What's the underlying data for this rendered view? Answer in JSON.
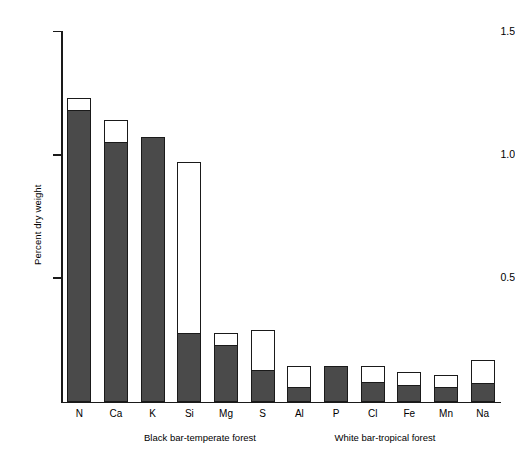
{
  "chart_data": {
    "type": "bar",
    "title": "",
    "xlabel": "",
    "ylabel": "Percent dry weight",
    "ylim": [
      0,
      1.5
    ],
    "yticks": [
      0.5,
      1.0,
      1.5
    ],
    "ytick_labels": [
      "0.5",
      "1.0",
      "1.5"
    ],
    "grid": false,
    "legend_position": "below-axis",
    "categories": [
      "N",
      "Ca",
      "K",
      "Si",
      "Mg",
      "S",
      "Al",
      "P",
      "Cl",
      "Fe",
      "Mn",
      "Na"
    ],
    "series": [
      {
        "name": "Black bar-temperate forest",
        "color": "#4a4a4a",
        "values": [
          1.18,
          1.05,
          1.07,
          0.28,
          0.23,
          0.13,
          0.06,
          0.145,
          0.08,
          0.07,
          0.06,
          0.077
        ]
      },
      {
        "name": "White bar-tropical forest",
        "color": "#ffffff",
        "values": [
          1.23,
          1.14,
          0.8,
          0.97,
          0.28,
          0.29,
          0.145,
          0.1,
          0.145,
          0.12,
          0.11,
          0.17
        ]
      }
    ],
    "annotations": [
      "Black bar-temperate forest",
      "White bar-tropical forest"
    ]
  },
  "axis": {
    "y_title": "Percent dry weight",
    "y_tick_labels": [
      "1.5",
      "1.0",
      "0.5"
    ],
    "x_tick_labels": [
      "N",
      "Ca",
      "K",
      "Si",
      "Mg",
      "S",
      "Al",
      "P",
      "Cl",
      "Fe",
      "Mn",
      "Na"
    ]
  },
  "captions": {
    "left": "Black bar-temperate forest",
    "right": "White bar-tropical forest"
  },
  "colors": {
    "bar_black": "#4a4a4a",
    "bar_white": "#ffffff",
    "outline": "#1a1a1a",
    "background": "#ffffff"
  }
}
